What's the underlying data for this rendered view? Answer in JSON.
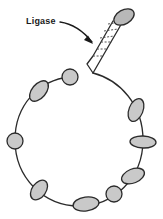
{
  "figure": {
    "background_color": "#ffffff",
    "stroke_color": "#2b2b2b",
    "bead_fill_color": "#c9c9c9",
    "cap_fill_color": "#b8b8b8",
    "rung_color": "#555555"
  },
  "annotation": {
    "label": "Ligase",
    "label_x": 26,
    "label_y": 24,
    "arrow_name": "curved-arrow",
    "arrow_path": "M 60 22 C 74 24 84 32 92 42",
    "arrow_tip_x": 93,
    "arrow_tip_y": 44
  },
  "loop": {
    "name": "circular-dna-loop",
    "center_x": 79,
    "center_y": 140,
    "radius_x": 64,
    "radius_y": 63,
    "path": "M 93 73 C 120 80 143 105 143 140 C 143 178 114 206 79 206 C 44 206 15 178 15 140 C 15 106 38 80 70 77"
  },
  "duplex": {
    "name": "dna-duplex-ladder",
    "strand_left_path": "M 93 73 L 87 64 L 93 56 L 113 21",
    "strand_right_path": "M 93 73 L 126 16",
    "cap_cx": 124,
    "cap_cy": 17,
    "cap_rx": 11,
    "cap_ry": 7,
    "cap_rotation": -30,
    "rungs": [
      {
        "x1": 93,
        "y1": 56,
        "x2": 104,
        "y2": 56
      },
      {
        "x1": 97,
        "y1": 49,
        "x2": 108,
        "y2": 49
      },
      {
        "x1": 101,
        "y1": 42,
        "x2": 112,
        "y2": 42
      },
      {
        "x1": 100,
        "y1": 38,
        "x2": 114,
        "y2": 36
      },
      {
        "x1": 104,
        "y1": 31,
        "x2": 118,
        "y2": 29
      },
      {
        "x1": 108,
        "y1": 24,
        "x2": 122,
        "y2": 22
      }
    ]
  },
  "beads": [
    {
      "name": "nucleosome-top-left-small",
      "cx": 70,
      "cy": 77,
      "rx": 8,
      "ry": 8,
      "rotation": 0
    },
    {
      "name": "nucleosome-upper-left",
      "cx": 39,
      "cy": 91,
      "rx": 7,
      "ry": 12,
      "rotation": 40
    },
    {
      "name": "nucleosome-left-small",
      "cx": 15,
      "cy": 141,
      "rx": 8,
      "ry": 8,
      "rotation": 0
    },
    {
      "name": "nucleosome-lower-left",
      "cx": 39,
      "cy": 190,
      "rx": 7,
      "ry": 11,
      "rotation": 35
    },
    {
      "name": "nucleosome-bottom",
      "cx": 86,
      "cy": 204,
      "rx": 13,
      "ry": 7,
      "rotation": -8
    },
    {
      "name": "nucleosome-bottom-right-small",
      "cx": 114,
      "cy": 194,
      "rx": 8,
      "ry": 8,
      "rotation": 0
    },
    {
      "name": "nucleosome-lower-right",
      "cx": 133,
      "cy": 176,
      "rx": 12,
      "ry": 7,
      "rotation": -22
    },
    {
      "name": "nucleosome-right-middle",
      "cx": 143,
      "cy": 142,
      "rx": 13,
      "ry": 6,
      "rotation": 2
    },
    {
      "name": "nucleosome-upper-right",
      "cx": 136,
      "cy": 110,
      "rx": 7,
      "ry": 12,
      "rotation": 22
    }
  ]
}
